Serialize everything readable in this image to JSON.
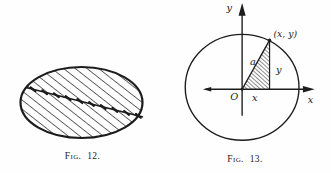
{
  "page": {
    "background": "#fefefe",
    "ink_color": "#1c1c1c"
  },
  "fig12": {
    "caption": "Fig. 12."
  },
  "fig13": {
    "caption": "Fig. 13.",
    "labels": {
      "y_axis": "y",
      "x_axis": "x",
      "point": "(x, y)",
      "hypotenuse": "a",
      "ordinate": "y",
      "abscissa": "x",
      "origin": "O"
    }
  }
}
